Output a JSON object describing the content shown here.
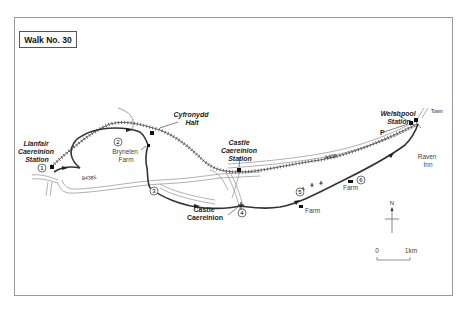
{
  "title": "Walk No. 30",
  "places": {
    "llanfair_station": [
      "Llanfair",
      "Caereinion",
      "Station"
    ],
    "cyfronydd_halt": [
      "Cyfronydd",
      "Halt"
    ],
    "castle_station": [
      "Castle",
      "Caereinion",
      "Station"
    ],
    "welshpool_station": [
      "Welshpool",
      "Station"
    ],
    "brynelen_farm": [
      "Brynelen",
      "Farm"
    ],
    "castle_caereinion": [
      "Castle",
      "Caereinion"
    ],
    "raven_inn": [
      "Raven",
      "Inn"
    ],
    "farm_1": "Farm",
    "farm_2": "Farm",
    "town": "Town",
    "parking": "P"
  },
  "roads": {
    "b4385": "B4385",
    "a458": "A458"
  },
  "waypoints": [
    "1",
    "2",
    "3",
    "4",
    "5",
    "6"
  ],
  "compass": {
    "north_label": "N"
  },
  "scale": {
    "start": "0",
    "end": "1km"
  },
  "colors": {
    "frame": "#9a9a9a",
    "road": "#9c9c9c",
    "railway": "#555555",
    "route": "#333333"
  }
}
